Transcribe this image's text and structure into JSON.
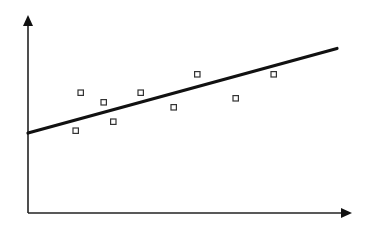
{
  "chart_data": {
    "type": "scatter",
    "title": "",
    "xlabel": "",
    "ylabel": "",
    "grid": false,
    "legend": null,
    "series": [
      {
        "name": "observations",
        "marker": "hollow-square",
        "points": [
          {
            "x": 75.7,
            "y": 130.7
          },
          {
            "x": 80.7,
            "y": 92.7
          },
          {
            "x": 103.7,
            "y": 102.3
          },
          {
            "x": 113.3,
            "y": 121.7
          },
          {
            "x": 140.7,
            "y": 92.7
          },
          {
            "x": 173.7,
            "y": 107.3
          },
          {
            "x": 197.3,
            "y": 74.3
          },
          {
            "x": 235.7,
            "y": 98.3
          },
          {
            "x": 273.7,
            "y": 74.3
          }
        ]
      }
    ],
    "trend_line": {
      "x1": 28,
      "y1": 133,
      "x2": 337,
      "y2": 48.5
    },
    "axes": {
      "origin": {
        "x": 28,
        "y": 213
      },
      "x_end": 352,
      "y_end": 15
    },
    "colors": {
      "axis": "#222222",
      "line": "#111111",
      "marker": "#333333"
    }
  }
}
